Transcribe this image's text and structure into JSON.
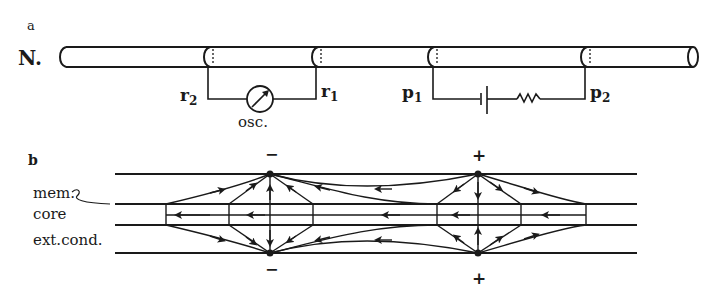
{
  "panel_a": {
    "label": "a",
    "nerve_label": "N.",
    "recording_electrodes": {
      "left": {
        "name": "r",
        "sub": "2"
      },
      "right": {
        "name": "r",
        "sub": "1"
      },
      "instrument_label": "osc."
    },
    "stimulating_electrodes": {
      "left": {
        "name": "p",
        "sub": "1"
      },
      "right": {
        "name": "p",
        "sub": "2"
      }
    },
    "icons": [
      "oscilloscope-meter-icon",
      "battery-icon",
      "resistor-icon"
    ]
  },
  "panel_b": {
    "label": "b",
    "layer_labels": {
      "membrane": "mem.",
      "core": "core",
      "external": "ext.cond."
    },
    "negative_node": {
      "top_sign": "−",
      "bottom_sign": "−"
    },
    "positive_node": {
      "top_sign": "+",
      "bottom_sign": "+"
    }
  },
  "colors": {
    "ink": "#1a1a1a",
    "background": "#ffffff"
  }
}
